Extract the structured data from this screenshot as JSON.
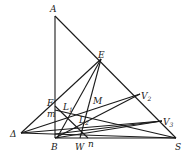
{
  "diagram": {
    "type": "geometry",
    "points": {
      "A": {
        "label": "A",
        "x": 55,
        "y": 16
      },
      "E": {
        "label": "E",
        "x": 101,
        "y": 59
      },
      "V2": {
        "label": "V",
        "sub": "2",
        "x": 140,
        "y": 94
      },
      "V3": {
        "label": "V",
        "sub": "3",
        "x": 162,
        "y": 121
      },
      "S": {
        "label": "S",
        "x": 176,
        "y": 138
      },
      "B": {
        "label": "B",
        "x": 55,
        "y": 138
      },
      "D": {
        "label": "Δ",
        "x": 21,
        "y": 133
      },
      "F": {
        "label": "F",
        "x": 55,
        "y": 110
      },
      "m": {
        "label": "m",
        "x": 55,
        "y": 118
      },
      "M": {
        "label": "M",
        "x": 95,
        "y": 106
      },
      "L1": {
        "label": "L",
        "sub": "1",
        "x": 68,
        "y": 112
      },
      "L2": {
        "label": "L",
        "sub": "2",
        "x": 82,
        "y": 121
      },
      "W": {
        "label": "W",
        "x": 80,
        "y": 138
      },
      "n": {
        "label": "n",
        "x": 90,
        "y": 138
      }
    }
  }
}
